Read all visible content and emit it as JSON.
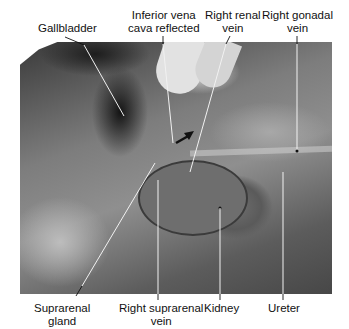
{
  "figure": {
    "type": "labeled anatomical photograph (grayscale)",
    "labels_top": [
      {
        "id": "gallbladder",
        "lines": [
          "Gallbladder"
        ]
      },
      {
        "id": "ivc",
        "lines": [
          "Inferior vena",
          "cava reflected"
        ]
      },
      {
        "id": "renal-vein",
        "lines": [
          "Right renal",
          "vein"
        ]
      },
      {
        "id": "gonadal-vein",
        "lines": [
          "Right gonadal",
          "vein"
        ]
      }
    ],
    "labels_bottom": [
      {
        "id": "suprarenal-gland",
        "lines": [
          "Suprarenal",
          "gland"
        ]
      },
      {
        "id": "suprarenal-vein",
        "lines": [
          "Right suprarenal",
          "vein"
        ]
      },
      {
        "id": "kidney",
        "lines": [
          "Kidney"
        ]
      },
      {
        "id": "ureter",
        "lines": [
          "Ureter"
        ]
      }
    ]
  },
  "colors": {
    "leader_line_on_light": "#111111",
    "leader_line_on_photo": "#f2f2f2",
    "text": "#111111"
  }
}
